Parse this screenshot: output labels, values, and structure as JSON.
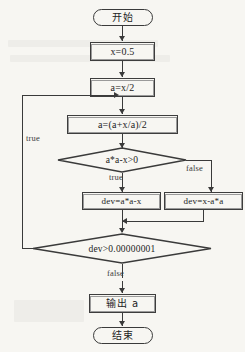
{
  "figure": {
    "colors": {
      "page_background": "#f7f6f2",
      "stroke": "#3a3a3a",
      "text": "#232323"
    }
  },
  "nodes": {
    "start": {
      "label": "开始",
      "shape": "terminal"
    },
    "init_x": {
      "label": "x=0.5",
      "shape": "process"
    },
    "init_a": {
      "label": "a=x/2",
      "shape": "process"
    },
    "iterate": {
      "label": "a=(a+x/a)/2",
      "shape": "process"
    },
    "decision_sign": {
      "label": "a*a-x>0",
      "shape": "decision"
    },
    "dev_pos": {
      "label": "dev=a*a-x",
      "shape": "process"
    },
    "dev_neg": {
      "label": "dev=x-a*a",
      "shape": "process"
    },
    "decision_tol": {
      "label": "dev>0.00000001",
      "shape": "decision"
    },
    "output": {
      "label": "输出 a",
      "shape": "process"
    },
    "end": {
      "label": "结束",
      "shape": "terminal"
    }
  },
  "edge_labels": {
    "loop_true": "true",
    "sign_true": "true",
    "sign_false": "false",
    "tol_false": "false"
  }
}
